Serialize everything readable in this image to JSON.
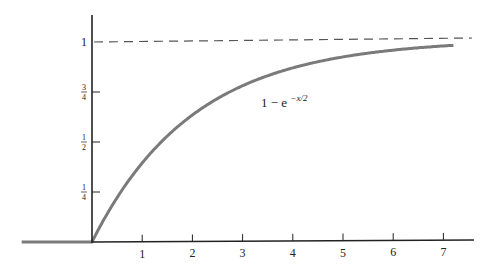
{
  "chart_data": {
    "type": "line",
    "title": "",
    "xlabel": "",
    "ylabel": "",
    "xlim": [
      -1.4,
      7.6
    ],
    "ylim": [
      0,
      1.1
    ],
    "grid": false,
    "legend": null,
    "x_ticks": [
      1,
      2,
      3,
      4,
      5,
      6,
      7
    ],
    "x_tick_labels": [
      "1",
      "2",
      "3",
      "4",
      "5",
      "6",
      "7"
    ],
    "y_ticks": [
      0.25,
      0.5,
      0.75,
      1
    ],
    "y_tick_labels": [
      {
        "num": "1",
        "den": "4"
      },
      {
        "num": "1",
        "den": "2"
      },
      {
        "num": "3",
        "den": "4"
      },
      {
        "whole": "1"
      }
    ],
    "series": [
      {
        "name": "1 - e^{-x/2}",
        "label_text": "1 − e",
        "label_exponent": "−x/2",
        "color": "#7a7a7a",
        "x": [
          -1.4,
          0,
          0.25,
          0.5,
          0.75,
          1,
          1.5,
          2,
          2.5,
          3,
          3.5,
          4,
          4.5,
          5,
          5.5,
          6,
          6.5,
          7,
          7.2
        ],
        "y": [
          0,
          0,
          0.1175,
          0.2212,
          0.3127,
          0.3935,
          0.5276,
          0.6321,
          0.7135,
          0.7769,
          0.8262,
          0.8647,
          0.8946,
          0.9179,
          0.9361,
          0.9502,
          0.9612,
          0.9698,
          0.9727
        ]
      }
    ],
    "annotations": [
      {
        "type": "asymptote",
        "y": 1,
        "style": "dashed",
        "color": "#555555"
      }
    ]
  },
  "colors": {
    "axis": "#222222",
    "curve": "#7a7a7a",
    "asymptote": "#555555"
  }
}
